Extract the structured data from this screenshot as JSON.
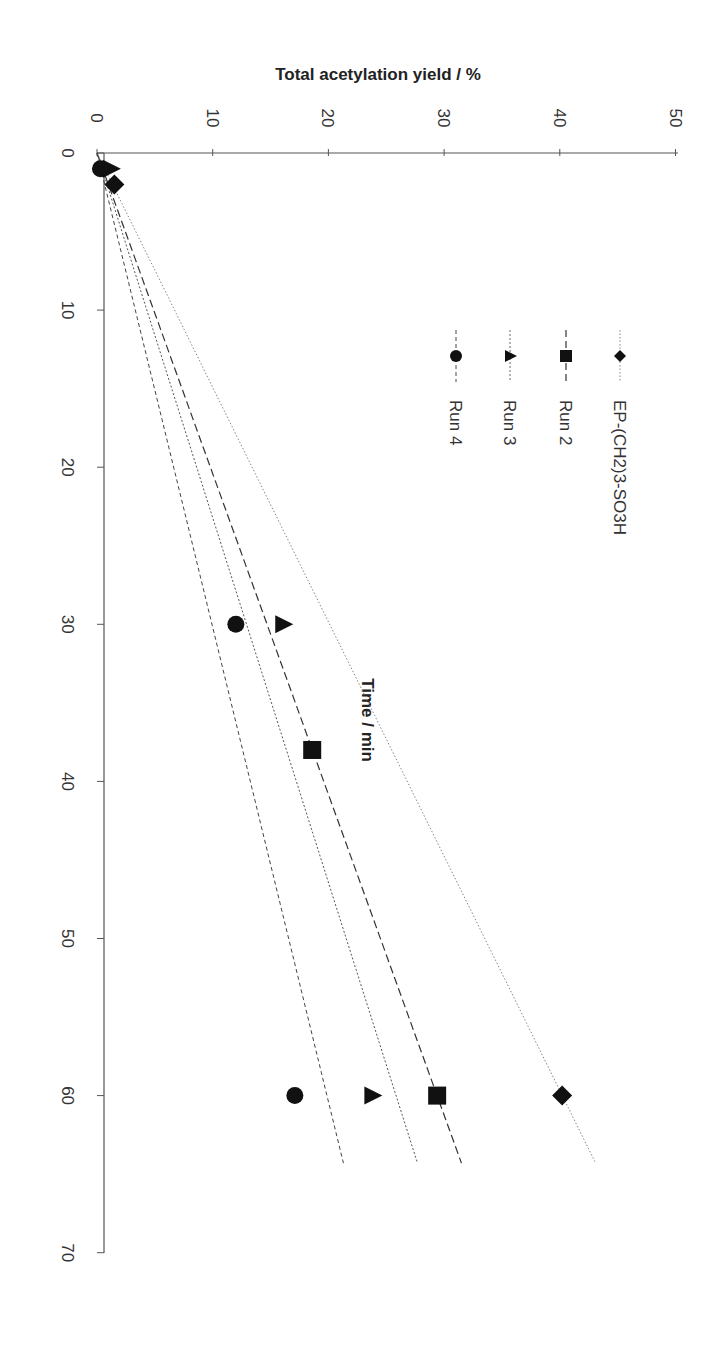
{
  "chart_data": {
    "type": "scatter",
    "orientation_note": "figure rotated 90 degrees clockwise",
    "title": "",
    "xlabel": "Time / min",
    "ylabel": "Total acetylation yield /  %",
    "xlim": [
      0,
      70
    ],
    "ylim": [
      0,
      50
    ],
    "x_ticks": [
      "0",
      "10",
      "20",
      "30",
      "40",
      "50",
      "60",
      "70"
    ],
    "y_ticks": [
      "0",
      "10",
      "20",
      "30",
      "40",
      "50"
    ],
    "grid": false,
    "legend_position": "inside upper-left (rotated)",
    "series": [
      {
        "name": "EP-(CH2)3-SO3H",
        "marker": "diamond",
        "line": "dotted",
        "points": [
          [
            2,
            1.5
          ],
          [
            60,
            40.2
          ]
        ],
        "trend_slope": 0.67,
        "trend_end": [
          64.3,
          43.1
        ]
      },
      {
        "name": "Run 2",
        "marker": "square",
        "line": "long-dash",
        "points": [
          [
            38,
            18.6
          ],
          [
            60,
            29.4
          ]
        ],
        "trend_slope": 0.49,
        "trend_end": [
          64.3,
          31.5
        ]
      },
      {
        "name": "Run 3",
        "marker": "triangle",
        "line": "short-dash",
        "points": [
          [
            1,
            1.2
          ],
          [
            30,
            16.1
          ],
          [
            60,
            23.8
          ]
        ],
        "trend_slope": 0.431,
        "trend_end": [
          64.3,
          27.7
        ]
      },
      {
        "name": "Run 4",
        "marker": "circle",
        "line": "dashed",
        "points": [
          [
            1,
            0.3
          ],
          [
            30,
            12.0
          ],
          [
            60,
            17.1
          ]
        ],
        "trend_slope": 0.331,
        "trend_end": [
          64.3,
          21.3
        ]
      }
    ]
  },
  "labels": {
    "xlabel": "Time / min",
    "ylabel": "Total acetylation yield /  %",
    "x_ticks": [
      "0",
      "10",
      "20",
      "30",
      "40",
      "50",
      "60",
      "70"
    ],
    "y_ticks": [
      "0",
      "10",
      "20",
      "30",
      "40",
      "50"
    ],
    "legend": [
      "EP-(CH2)3-SO3H",
      "Run 2",
      "Run 3",
      "Run 4"
    ]
  }
}
